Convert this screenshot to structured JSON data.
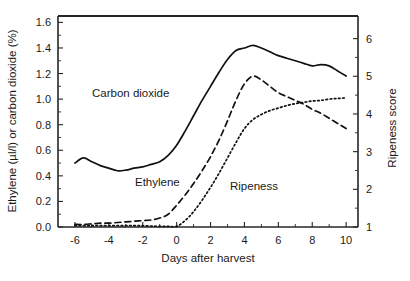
{
  "chart_data": {
    "type": "line",
    "title": "",
    "xlabel": "Days after harvest",
    "ylabel": "Ethylene (µl/l) or carbon dioxide (%)",
    "ylabel_right": "Ripeness score",
    "xlim": [
      -7,
      10.7
    ],
    "ylim": [
      0.0,
      1.65
    ],
    "ylim_right": [
      1,
      6.6
    ],
    "grid": false,
    "legend_position": "inline-annotations",
    "xticks": [
      -6,
      -4,
      -2,
      0,
      2,
      4,
      6,
      8,
      10
    ],
    "xticklabels": [
      "-6",
      "-4",
      "-2",
      "0",
      "2",
      "4",
      "6",
      "8",
      "10"
    ],
    "yticks": [
      0.0,
      0.2,
      0.4,
      0.6,
      0.8,
      1.0,
      1.2,
      1.4,
      1.6
    ],
    "yticklabels": [
      "0.0",
      "0.2",
      "0.4",
      "0.6",
      "0.8",
      "1.0",
      "1.2",
      "1.4",
      "1.6"
    ],
    "yticks_right": [
      1,
      2,
      3,
      4,
      5,
      6
    ],
    "yticklabels_right": [
      "1",
      "2",
      "3",
      "4",
      "5",
      "6"
    ],
    "series": [
      {
        "name": "Carbon dioxide",
        "style": "solid",
        "axis": "left",
        "x": [
          -6,
          -5.5,
          -5,
          -4.5,
          -4,
          -3.5,
          -3,
          -2.5,
          -2,
          -1.5,
          -1,
          -0.5,
          0,
          0.5,
          1,
          1.5,
          2,
          2.5,
          3,
          3.5,
          4,
          4.5,
          5,
          5.5,
          6,
          6.5,
          7,
          7.5,
          8,
          8.5,
          9,
          9.5,
          10
        ],
        "values": [
          0.5,
          0.54,
          0.51,
          0.48,
          0.46,
          0.44,
          0.445,
          0.46,
          0.47,
          0.49,
          0.51,
          0.56,
          0.64,
          0.75,
          0.87,
          0.99,
          1.1,
          1.21,
          1.31,
          1.38,
          1.4,
          1.42,
          1.4,
          1.37,
          1.34,
          1.32,
          1.3,
          1.28,
          1.26,
          1.27,
          1.26,
          1.22,
          1.18
        ]
      },
      {
        "name": "Ethylene",
        "style": "dashed",
        "axis": "left",
        "x": [
          -6,
          -5.5,
          -5,
          -4.5,
          -4,
          -3.5,
          -3,
          -2.5,
          -2,
          -1.5,
          -1,
          -0.5,
          0,
          0.5,
          1,
          1.5,
          2,
          2.5,
          3,
          3.5,
          4,
          4.5,
          5,
          5.5,
          6,
          6.5,
          7,
          7.5,
          8,
          8.5,
          9,
          9.5,
          10
        ],
        "values": [
          0.02,
          0.02,
          0.025,
          0.03,
          0.03,
          0.035,
          0.04,
          0.045,
          0.05,
          0.055,
          0.07,
          0.1,
          0.17,
          0.25,
          0.34,
          0.44,
          0.55,
          0.68,
          0.83,
          0.99,
          1.12,
          1.18,
          1.15,
          1.1,
          1.05,
          1.02,
          0.99,
          0.96,
          0.92,
          0.89,
          0.85,
          0.81,
          0.77
        ]
      },
      {
        "name": "Ripeness",
        "style": "dotted",
        "axis": "right",
        "x": [
          -6,
          -5,
          -4,
          -3,
          -2,
          -1,
          -0.5,
          0,
          0.5,
          1,
          1.5,
          2,
          2.5,
          3,
          3.5,
          4,
          4.5,
          5,
          5.5,
          6,
          6.5,
          7,
          7.5,
          8,
          8.5,
          9,
          9.5,
          10
        ],
        "values_left_scale": [
          0.01,
          0.01,
          0.01,
          0.01,
          0.01,
          0.005,
          0.005,
          0.005,
          0.05,
          0.12,
          0.21,
          0.31,
          0.42,
          0.54,
          0.66,
          0.77,
          0.84,
          0.88,
          0.91,
          0.93,
          0.95,
          0.965,
          0.975,
          0.985,
          0.99,
          1.0,
          1.005,
          1.01
        ],
        "values_score": [
          1.04,
          1.04,
          1.04,
          1.04,
          1.04,
          1.02,
          1.02,
          1.02,
          1.2,
          1.5,
          1.87,
          2.3,
          2.76,
          3.25,
          3.76,
          4.21,
          4.5,
          4.67,
          4.8,
          4.88,
          4.96,
          5.02,
          5.06,
          5.1,
          5.12,
          5.16,
          5.18,
          5.2
        ]
      }
    ],
    "annotations": [
      {
        "text": "Carbon dioxide",
        "x_px": 92,
        "y_px": 97
      },
      {
        "text": "Ethylene",
        "x_px": 135,
        "y_px": 186
      },
      {
        "text": "Ripeness",
        "x_px": 230,
        "y_px": 190
      }
    ]
  }
}
